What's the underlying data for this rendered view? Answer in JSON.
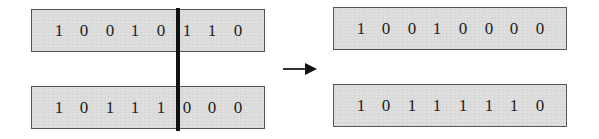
{
  "diagram": {
    "title": "",
    "crossover_point": 5,
    "parents": [
      {
        "label": "parent-1",
        "bits": [
          "1",
          "0",
          "0",
          "1",
          "0",
          "1",
          "1",
          "0"
        ]
      },
      {
        "label": "parent-2",
        "bits": [
          "1",
          "0",
          "1",
          "1",
          "1",
          "0",
          "0",
          "0"
        ]
      }
    ],
    "offspring": [
      {
        "label": "offspring-1",
        "bits": [
          "1",
          "0",
          "0",
          "1",
          "0",
          "0",
          "0",
          "0"
        ]
      },
      {
        "label": "offspring-2",
        "bits": [
          "1",
          "0",
          "1",
          "1",
          "1",
          "1",
          "1",
          "0"
        ]
      }
    ],
    "colors": {
      "box_fill": "#dcdcdc",
      "box_border": "#555555",
      "divider": "#111111",
      "arrow": "#111111",
      "text": "#222222"
    }
  }
}
